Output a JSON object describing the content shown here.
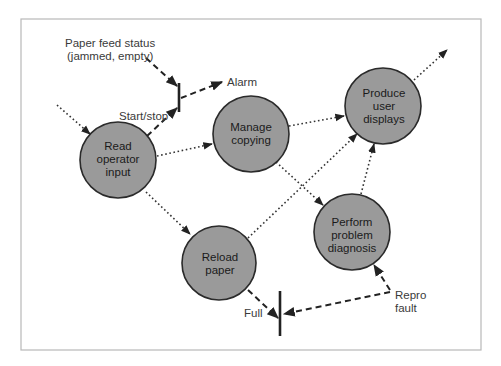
{
  "diagram": {
    "type": "data-flow diagram",
    "nodes": [
      {
        "id": "read",
        "lines": [
          "Read",
          "operator",
          "input"
        ],
        "cx": 118,
        "cy": 160,
        "r": 38
      },
      {
        "id": "manage",
        "lines": [
          "Manage",
          "copying"
        ],
        "cx": 251,
        "cy": 134,
        "r": 38
      },
      {
        "id": "produce",
        "lines": [
          "Produce",
          "user",
          "displays"
        ],
        "cx": 383,
        "cy": 106,
        "r": 38
      },
      {
        "id": "reload",
        "lines": [
          "Reload",
          "paper"
        ],
        "cx": 219,
        "cy": 263,
        "r": 37
      },
      {
        "id": "diagnose",
        "lines": [
          "Perform",
          "problem",
          "diagnosis"
        ],
        "cx": 352,
        "cy": 232,
        "r": 38
      }
    ],
    "labels": {
      "paper_feed_line1": "Paper feed status",
      "paper_feed_line2": "(jammed, empty)",
      "alarm": "Alarm",
      "start_stop": "Start/stop",
      "full": "Full",
      "repro_line1": "Repro",
      "repro_line2": "fault"
    },
    "flows": [
      {
        "from": "external",
        "to": "read",
        "style": "dotted"
      },
      {
        "from": "read",
        "to": "manage",
        "style": "dotted"
      },
      {
        "from": "read",
        "to": "reload",
        "style": "dotted"
      },
      {
        "from": "manage",
        "to": "produce",
        "style": "dotted"
      },
      {
        "from": "manage",
        "to": "diagnose",
        "style": "dotted"
      },
      {
        "from": "reload",
        "to": "produce",
        "style": "dotted"
      },
      {
        "from": "diagnose",
        "to": "produce",
        "style": "dotted"
      },
      {
        "from": "produce",
        "to": "external",
        "style": "dotted"
      },
      {
        "from": "Paper feed status",
        "to": "top-bar",
        "style": "dashed"
      },
      {
        "from": "read",
        "to": "top-bar",
        "label": "Start/stop",
        "style": "dashed"
      },
      {
        "from": "top-bar",
        "to": "Alarm",
        "style": "dashed"
      },
      {
        "from": "reload",
        "to": "bottom-bar",
        "label": "Full",
        "style": "dashed"
      },
      {
        "from": "Repro fault",
        "to": "bottom-bar",
        "style": "dashed"
      },
      {
        "from": "Repro fault",
        "to": "diagnose",
        "style": "dashed"
      }
    ]
  }
}
